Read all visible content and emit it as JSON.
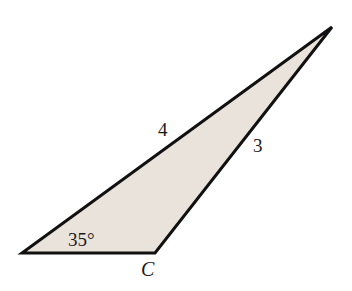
{
  "diagram": {
    "type": "triangle",
    "fill_color": "#e9e3dc",
    "stroke_color": "#111111",
    "vertices": {
      "left": {
        "x": 22,
        "y": 253
      },
      "C": {
        "x": 155,
        "y": 253
      },
      "top": {
        "x": 332,
        "y": 27
      }
    },
    "labels": {
      "side_left_top": "4",
      "side_C_top": "3",
      "angle_left": "35°",
      "vertex_C": "C"
    }
  }
}
